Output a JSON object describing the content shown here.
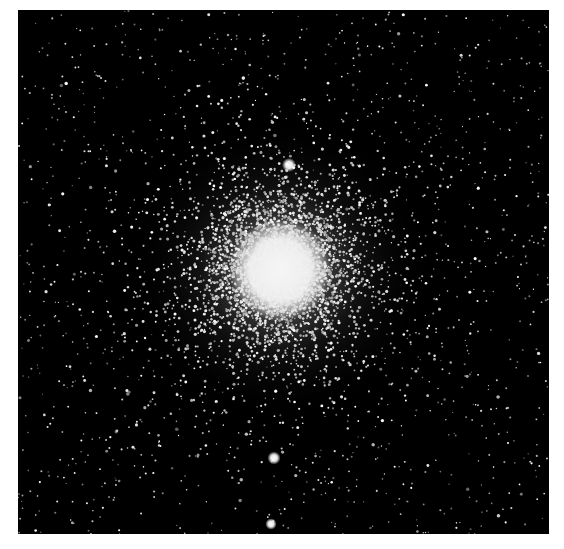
{
  "image": {
    "subject": "Globular star cluster photographed against black sky",
    "description": "Dense bright core with scattered field stars",
    "background_color": "#000000",
    "border_color": "#ffffff",
    "frame": {
      "x": 18,
      "y": 10,
      "width": 531,
      "height": 524
    },
    "cluster_center": {
      "x": 262,
      "y": 260
    },
    "core_radius": 38,
    "halo_radius": 150,
    "bright_stars": [
      {
        "x": 271,
        "y": 155,
        "r": 3.2
      },
      {
        "x": 256,
        "y": 448,
        "r": 3.0
      },
      {
        "x": 253,
        "y": 514,
        "r": 2.6
      }
    ],
    "star_seed": 42,
    "field_star_count": 1400,
    "cluster_star_count": 5200
  }
}
